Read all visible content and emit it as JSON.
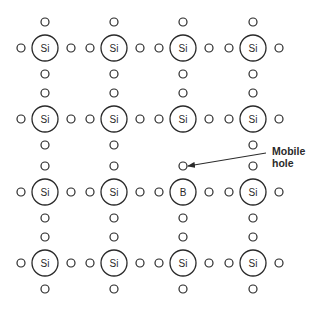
{
  "diagram": {
    "grid": {
      "columns_x": [
        45,
        114,
        183,
        253
      ],
      "rows_y": [
        48,
        119,
        192,
        263
      ],
      "atom_radius": 13,
      "electron_radius": 4,
      "electron_offset": 26
    },
    "atoms": [
      [
        "Si",
        "Si",
        "Si",
        "Si"
      ],
      [
        "Si",
        "Si",
        "Si",
        "Si"
      ],
      [
        "Si",
        "Si",
        "B",
        "Si"
      ],
      [
        "Si",
        "Si",
        "Si",
        "Si"
      ]
    ],
    "missing_electron": {
      "row": 1,
      "col": 2,
      "side": "below",
      "note": "hole left by boron acceptor"
    },
    "annotation": {
      "line1": "Mobile",
      "line2": "hole",
      "arrow_from": [
        266,
        153
      ],
      "arrow_to": [
        188,
        166
      ]
    },
    "colors": {
      "stroke": "#2a2a2a",
      "background": "#ffffff"
    }
  }
}
